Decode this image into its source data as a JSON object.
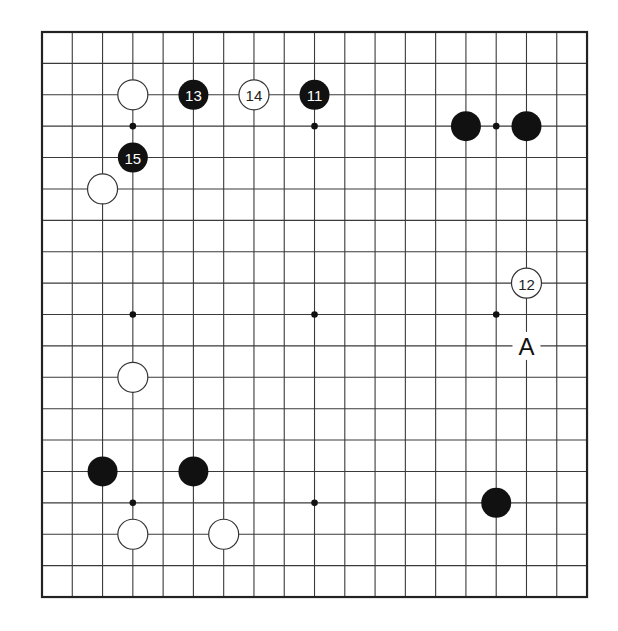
{
  "board": {
    "size": 19,
    "origin": {
      "x": 42,
      "y": 32
    },
    "spacing": {
      "x": 30.28,
      "y": 31.39
    },
    "stone_radius": 15,
    "colors": {
      "line": "#3a3a3a",
      "black": "#111111",
      "white": "#ffffff",
      "background": "#ffffff"
    },
    "hoshi": [
      {
        "col": 3,
        "row": 3
      },
      {
        "col": 9,
        "row": 3
      },
      {
        "col": 15,
        "row": 3
      },
      {
        "col": 3,
        "row": 9
      },
      {
        "col": 9,
        "row": 9
      },
      {
        "col": 15,
        "row": 9
      },
      {
        "col": 3,
        "row": 15
      },
      {
        "col": 9,
        "row": 15
      },
      {
        "col": 15,
        "row": 15
      }
    ],
    "stones": [
      {
        "color": "white",
        "col": 3,
        "row": 2,
        "number": ""
      },
      {
        "color": "black",
        "col": 5,
        "row": 2,
        "number": "13"
      },
      {
        "color": "white",
        "col": 7,
        "row": 2,
        "number": "14"
      },
      {
        "color": "black",
        "col": 9,
        "row": 2,
        "number": "11"
      },
      {
        "color": "black",
        "col": 14,
        "row": 3,
        "number": ""
      },
      {
        "color": "black",
        "col": 16,
        "row": 3,
        "number": ""
      },
      {
        "color": "black",
        "col": 3,
        "row": 4,
        "number": "15"
      },
      {
        "color": "white",
        "col": 2,
        "row": 5,
        "number": ""
      },
      {
        "color": "white",
        "col": 16,
        "row": 8,
        "number": "12"
      },
      {
        "color": "white",
        "col": 3,
        "row": 11,
        "number": ""
      },
      {
        "color": "black",
        "col": 2,
        "row": 14,
        "number": ""
      },
      {
        "color": "black",
        "col": 5,
        "row": 14,
        "number": ""
      },
      {
        "color": "black",
        "col": 15,
        "row": 15,
        "number": ""
      },
      {
        "color": "white",
        "col": 3,
        "row": 16,
        "number": ""
      },
      {
        "color": "white",
        "col": 6,
        "row": 16,
        "number": ""
      }
    ],
    "labels": [
      {
        "text": "A",
        "col": 16,
        "row": 10
      }
    ]
  }
}
